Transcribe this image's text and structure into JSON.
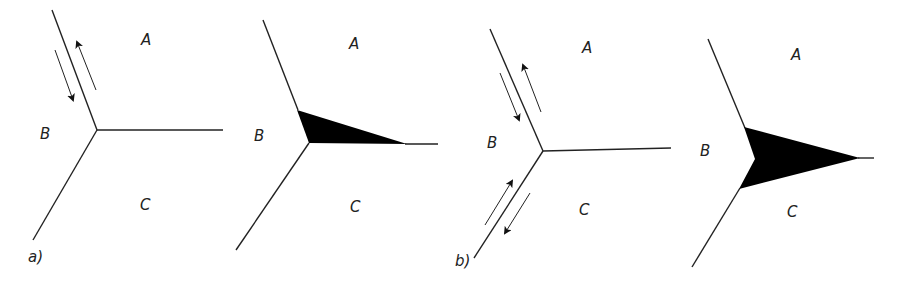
{
  "figure": {
    "panels": [
      {
        "id": "a1",
        "caption": "a)",
        "labels": {
          "A": "A",
          "B": "B",
          "C": "C"
        },
        "shaded_wedge": false,
        "sliding_arrows": "upper-boundary"
      },
      {
        "id": "a2",
        "caption": "",
        "labels": {
          "A": "A",
          "B": "B",
          "C": "C"
        },
        "shaded_wedge": true,
        "wedge_size": "small"
      },
      {
        "id": "b1",
        "caption": "b)",
        "labels": {
          "A": "A",
          "B": "B",
          "C": "C"
        },
        "shaded_wedge": false,
        "sliding_arrows": "upper-and-lower-boundaries"
      },
      {
        "id": "b2",
        "caption": "",
        "labels": {
          "A": "A",
          "B": "B",
          "C": "C"
        },
        "shaded_wedge": true,
        "wedge_size": "large"
      }
    ],
    "colors": {
      "line": "#222222",
      "wedge": "#000000",
      "background": "#ffffff"
    }
  }
}
